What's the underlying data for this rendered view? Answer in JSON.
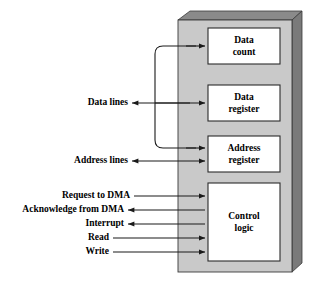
{
  "figure": {
    "type": "block-diagram",
    "background_color": "#ffffff",
    "body_fill": "#c9c9c9",
    "body_top_fill": "#8a8a8a",
    "body_side_fill": "#7a7a7a",
    "inner_box_fill": "#ffffff",
    "line_color": "#1a1a1a"
  },
  "blocks": [
    {
      "id": "data-count",
      "label_line1": "Data",
      "label_line2": "count"
    },
    {
      "id": "data-register",
      "label_line1": "Data",
      "label_line2": "register"
    },
    {
      "id": "address-register",
      "label_line1": "Address",
      "label_line2": "register"
    },
    {
      "id": "control-logic",
      "label_line1": "Control",
      "label_line2": "logic"
    }
  ],
  "signals": [
    {
      "id": "data-lines",
      "label": "Data lines",
      "direction": "bidirectional"
    },
    {
      "id": "address-lines",
      "label": "Address lines",
      "direction": "out"
    },
    {
      "id": "request-to-dma",
      "label": "Request to DMA",
      "direction": "in"
    },
    {
      "id": "acknowledge-from-dma",
      "label": "Acknowledge from DMA",
      "direction": "out"
    },
    {
      "id": "interrupt",
      "label": "Interrupt",
      "direction": "out"
    },
    {
      "id": "read",
      "label": "Read",
      "direction": "in"
    },
    {
      "id": "write",
      "label": "Write",
      "direction": "in"
    }
  ]
}
